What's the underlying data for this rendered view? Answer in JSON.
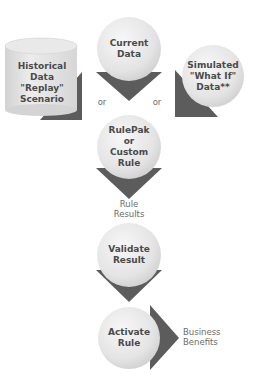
{
  "diagram": {
    "type": "flowchart",
    "colors": {
      "node_fill": "#e6e6e6",
      "node_highlight": "#f7f7f7",
      "arrow_fill": "#5c5c5c",
      "text": "#4a4a4a",
      "label_text": "#6b6b6b"
    },
    "inputs": {
      "historical": {
        "lines": [
          "Historical",
          "Data",
          "\"Replay\"",
          "Scenario"
        ]
      },
      "current": {
        "lines": [
          "Current",
          "Data"
        ]
      },
      "simulated": {
        "lines": [
          "Simulated",
          "\"What If\"",
          "Data**"
        ]
      }
    },
    "connectors": {
      "or_left": "or",
      "or_right": "or"
    },
    "steps": {
      "rulepak": {
        "lines": [
          "RulePak",
          "or",
          "Custom",
          "Rule"
        ]
      },
      "validate": {
        "lines": [
          "Validate",
          "Result"
        ]
      },
      "activate": {
        "lines": [
          "Activate",
          "Rule"
        ]
      }
    },
    "edge_labels": {
      "rule_results": [
        "Rule",
        "Results"
      ],
      "business_benefits": [
        "Business",
        "Benefits"
      ]
    }
  }
}
